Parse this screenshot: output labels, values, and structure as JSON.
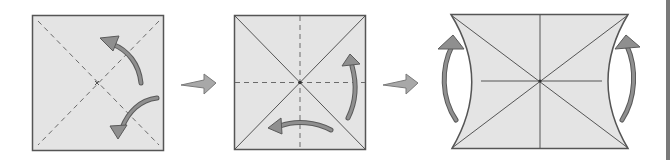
{
  "diagram": {
    "type": "origami-fold-sequence",
    "step_count": 3,
    "colors": {
      "paper_fill": "#e4e4e4",
      "paper_edge": "#555555",
      "crease_line": "#6a6a6a",
      "arrow_fill": "#8f8f8f",
      "arrow_edge": "#5a5a5a",
      "next_step_arrow": "#a8a8a8",
      "edge_strip": "#7a7a7a"
    },
    "steps": [
      {
        "id": "step-1",
        "description": "Square sheet with both diagonals as dashed valley-fold creases; curved arrows indicate folding along the diagonals",
        "creases": [
          "diagonal-dashed",
          "anti-diagonal-dashed"
        ],
        "arrows": [
          "curved-arrow-up-left",
          "curved-arrow-down-left"
        ]
      },
      {
        "id": "step-2",
        "description": "Square with solid diagonal creases and dashed horizontal/vertical midline creases; curved arrows indicate next folds",
        "creases": [
          "diagonal-solid",
          "anti-diagonal-solid",
          "horizontal-dashed",
          "vertical-dashed"
        ],
        "arrows": [
          "curved-arrow-up",
          "curved-arrow-left"
        ]
      },
      {
        "id": "step-3",
        "description": "Sheet with concave left and right sides after collapsing; curved arrows on both sides point upward",
        "creases": [
          "diagonal-solid",
          "anti-diagonal-solid",
          "horizontal-solid",
          "vertical-solid"
        ],
        "arrows": [
          "curved-arrow-left-side-up",
          "curved-arrow-right-side-up"
        ]
      }
    ],
    "transitions": [
      {
        "from": "step-1",
        "to": "step-2",
        "icon": "right-arrow"
      },
      {
        "from": "step-2",
        "to": "step-3",
        "icon": "right-arrow"
      }
    ]
  }
}
